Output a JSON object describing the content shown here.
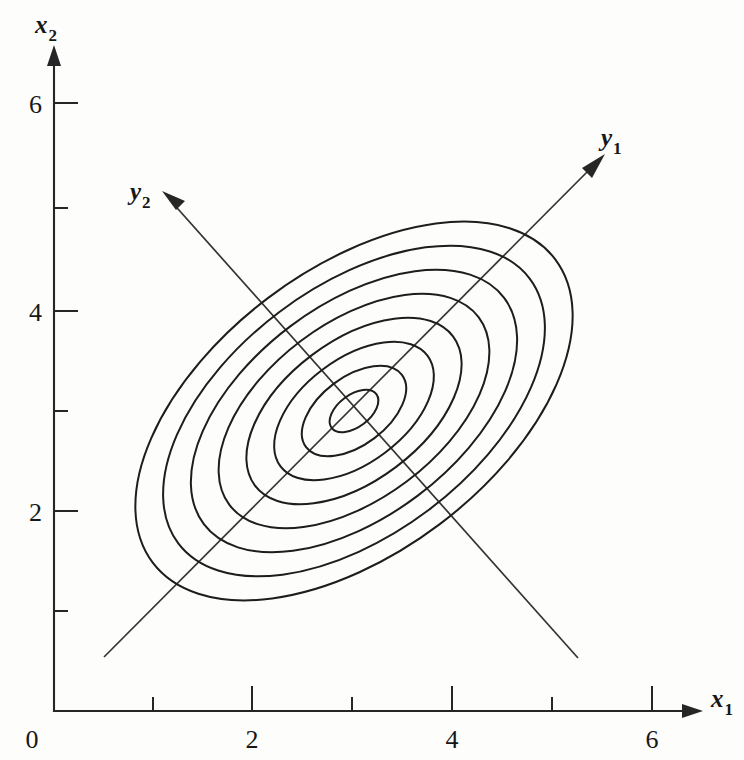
{
  "figure": {
    "background_color": "#fdfdfc",
    "ink_color": "#1d1d1d"
  },
  "axes": {
    "x_axis": {
      "name": "x1-axis",
      "label": "x",
      "label_subscript": "1",
      "tick_labels": [
        "0",
        "2",
        "4",
        "6"
      ],
      "tick_values": [
        0,
        2,
        4,
        6
      ],
      "minor_tick_values": [
        1,
        3,
        5
      ],
      "arrow": true
    },
    "y_axis": {
      "name": "x2-axis",
      "label": "x",
      "label_subscript": "2",
      "tick_labels": [
        "2",
        "4",
        "6"
      ],
      "tick_values": [
        2,
        4,
        6
      ],
      "minor_tick_values": [
        1,
        3,
        5
      ],
      "arrow": true
    }
  },
  "principal_axes": [
    {
      "id": "y1",
      "label": "y",
      "label_subscript": "1",
      "description": "major principal axis, positive slope",
      "angle_deg": 37,
      "arrow_end": "upper-right"
    },
    {
      "id": "y2",
      "label": "y",
      "label_subscript": "2",
      "description": "minor principal axis, negative slope",
      "angle_deg": 127,
      "arrow_end": "upper-left"
    }
  ],
  "chart_data": {
    "type": "line",
    "subtype": "contour-ellipses",
    "title": "",
    "xlabel": "x1",
    "ylabel": "x2",
    "xlim": [
      0,
      6.6
    ],
    "ylim": [
      0,
      6.6
    ],
    "grid": false,
    "legend": "none",
    "center": [
      3.0,
      3.0
    ],
    "rotation_deg": 37,
    "contour_count": 8,
    "contours": [
      {
        "index": 1,
        "semi_major": 0.28,
        "semi_minor": 0.16
      },
      {
        "index": 2,
        "semi_major": 0.6,
        "semi_minor": 0.34
      },
      {
        "index": 3,
        "semi_major": 0.92,
        "semi_minor": 0.52
      },
      {
        "index": 4,
        "semi_major": 1.24,
        "semi_minor": 0.7
      },
      {
        "index": 5,
        "semi_major": 1.56,
        "semi_minor": 0.88
      },
      {
        "index": 6,
        "semi_major": 1.88,
        "semi_minor": 1.06
      },
      {
        "index": 7,
        "semi_major": 2.2,
        "semi_minor": 1.24
      },
      {
        "index": 8,
        "semi_major": 2.52,
        "semi_minor": 1.42
      }
    ],
    "annotations": [
      {
        "text": "y1",
        "position": [
          5.54,
          5.71
        ]
      },
      {
        "text": "y2",
        "position": [
          0.96,
          5.19
        ]
      }
    ]
  }
}
